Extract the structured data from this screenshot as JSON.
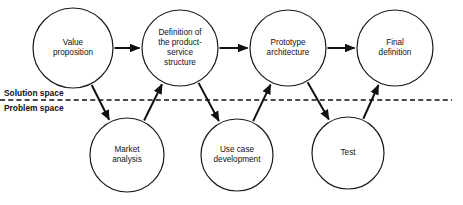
{
  "diagram": {
    "colors": {
      "background": "#ffffff",
      "stroke": "#111111",
      "node_fill": "#ffffff",
      "text": "#111111"
    },
    "divider": {
      "above_label": "Solution space",
      "below_label": "Problem space",
      "style": "dashed",
      "y": 100,
      "x_start": 0,
      "x_end": 452
    },
    "solution_nodes": [
      {
        "id": "value-proposition",
        "lines": [
          "Value",
          "proposition"
        ],
        "cx": 73,
        "cy": 48,
        "r": 40
      },
      {
        "id": "product-service-structure",
        "lines": [
          "Definition of",
          "the product-",
          "service",
          "structure"
        ],
        "cx": 180,
        "cy": 48,
        "r": 38
      },
      {
        "id": "prototype-architecture",
        "lines": [
          "Prototype",
          "architecture"
        ],
        "cx": 288,
        "cy": 48,
        "r": 38
      },
      {
        "id": "final-definition",
        "lines": [
          "Final",
          "definition"
        ],
        "cx": 395,
        "cy": 48,
        "r": 38
      }
    ],
    "problem_nodes": [
      {
        "id": "market-analysis",
        "lines": [
          "Market",
          "analysis"
        ],
        "cx": 127,
        "cy": 155,
        "r": 37
      },
      {
        "id": "use-case-development",
        "lines": [
          "Use case",
          "development"
        ],
        "cx": 237,
        "cy": 155,
        "r": 36
      },
      {
        "id": "test",
        "lines": [
          "Test"
        ],
        "cx": 348,
        "cy": 153,
        "r": 36
      }
    ],
    "connections": [
      {
        "id": "vp-to-pss",
        "from": "value-proposition",
        "to": "product-service-structure",
        "kind": "horizontal"
      },
      {
        "id": "pss-to-pa",
        "from": "product-service-structure",
        "to": "prototype-architecture",
        "kind": "horizontal"
      },
      {
        "id": "pa-to-fd",
        "from": "prototype-architecture",
        "to": "final-definition",
        "kind": "horizontal"
      },
      {
        "id": "vp-to-market-analysis",
        "from": "value-proposition",
        "to": "market-analysis",
        "kind": "down-right"
      },
      {
        "id": "market-analysis-to-pss",
        "from": "market-analysis",
        "to": "product-service-structure",
        "kind": "up-right"
      },
      {
        "id": "pss-to-use-case",
        "from": "product-service-structure",
        "to": "use-case-development",
        "kind": "down-right"
      },
      {
        "id": "use-case-to-pa",
        "from": "use-case-development",
        "to": "prototype-architecture",
        "kind": "up-right"
      },
      {
        "id": "pa-to-test",
        "from": "prototype-architecture",
        "to": "test",
        "kind": "down-right"
      },
      {
        "id": "test-to-fd",
        "from": "test",
        "to": "final-definition",
        "kind": "up-right"
      }
    ]
  }
}
